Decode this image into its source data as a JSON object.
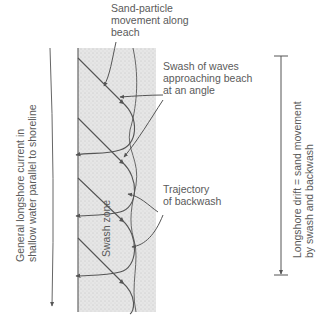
{
  "diagram": {
    "type": "longshore-drift",
    "labels": {
      "sand_particle": [
        "Sand-particle",
        "movement along",
        "beach"
      ],
      "swash_waves": [
        "Swash of waves",
        "approaching beach",
        "at an angle"
      ],
      "trajectory": [
        "Trajectory",
        "of backwash"
      ],
      "swash_zone": "Swash zone",
      "longshore_current": [
        "General longshore current in",
        "shallow water parallel to shoreline"
      ],
      "longshore_drift": [
        "Longshore drift = sand movement",
        "by swash and backwash"
      ]
    },
    "colors": {
      "line": "#555555",
      "sand": "#e2e2e2",
      "text": "#5a5a5a"
    }
  }
}
